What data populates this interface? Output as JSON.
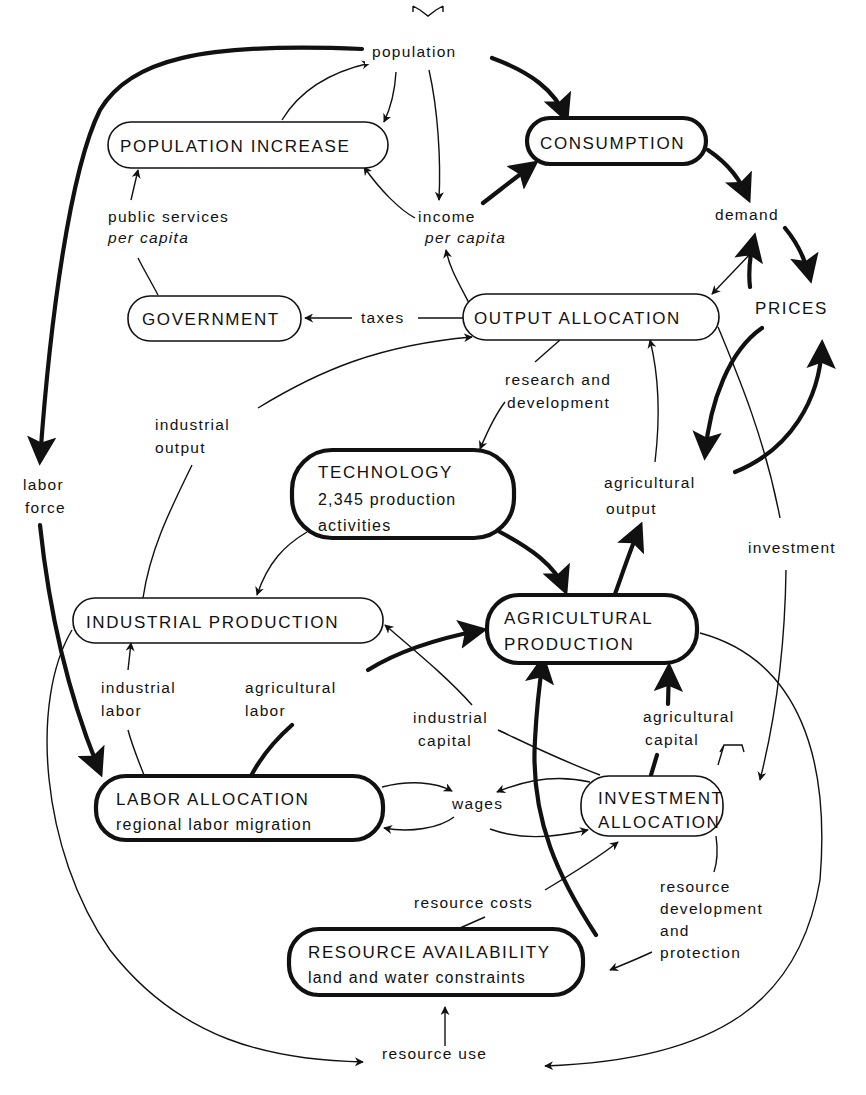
{
  "diagram": {
    "nodes": {
      "population_increase": "POPULATION INCREASE",
      "consumption": "CONSUMPTION",
      "government": "GOVERNMENT",
      "output_allocation": "OUTPUT ALLOCATION",
      "technology": [
        "TECHNOLOGY",
        "2,345 production",
        "activities"
      ],
      "industrial_production": "INDUSTRIAL PRODUCTION",
      "agricultural_production": [
        "AGRICULTURAL",
        "PRODUCTION"
      ],
      "labor_allocation": [
        "LABOR ALLOCATION",
        "regional labor migration"
      ],
      "investment_allocation": [
        "INVESTMENT",
        "ALLOCATION"
      ],
      "resource_availability": [
        "RESOURCE AVAILABILITY",
        "land and water constraints"
      ]
    },
    "labels": {
      "population": "population",
      "public_services": [
        "public services",
        "per capita"
      ],
      "income": [
        "income",
        "per capita"
      ],
      "demand": "demand",
      "prices": "PRICES",
      "taxes": "taxes",
      "research": [
        "research and",
        "development"
      ],
      "industrial_output": [
        "industrial",
        "output"
      ],
      "labor_force": [
        "labor",
        "force"
      ],
      "agricultural_output": [
        "agricultural",
        "output"
      ],
      "investment": "investment",
      "industrial_labor": [
        "industrial",
        "labor"
      ],
      "agricultural_labor": [
        "agricultural",
        "labor"
      ],
      "industrial_capital": [
        "industrial",
        "capital"
      ],
      "agricultural_capital": [
        "agricultural",
        "capital"
      ],
      "wages": "wages",
      "resource_costs": "resource costs",
      "resource_dev": [
        "resource",
        "development",
        "and",
        "protection"
      ],
      "resource_use": "resource use"
    },
    "colors": {
      "ink": "#111111",
      "background": "#ffffff"
    }
  }
}
